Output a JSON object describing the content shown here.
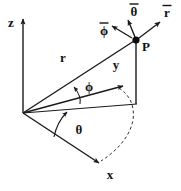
{
  "figure": {
    "type": "spherical-coordinate-diagram",
    "background_color": "#ffffff",
    "stroke_color": "#1a1a1a",
    "width": 181,
    "height": 191
  },
  "axes": [
    {
      "key": "z",
      "label": "z",
      "label_x": 11,
      "label_y": 24,
      "arrow": "up"
    },
    {
      "key": "y",
      "label": "y",
      "label_x": 116,
      "label_y": 66,
      "arrow": "up-right"
    },
    {
      "key": "x",
      "label": "x",
      "label_x": 110,
      "label_y": 176,
      "arrow": "down-right"
    }
  ],
  "point": {
    "label": "P",
    "label_x": 146,
    "label_y": 48,
    "x": 136,
    "y": 40
  },
  "unit_vectors": [
    {
      "key": "r-hat",
      "label": "r",
      "bar": true,
      "label_x": 167,
      "label_y": 14
    },
    {
      "key": "theta-hat",
      "label": "θ",
      "bar": true,
      "label_x": 134,
      "label_y": 13
    },
    {
      "key": "phi-hat",
      "label": "ϕ",
      "bar": true,
      "label_x": 104,
      "label_y": 32
    }
  ],
  "measures": [
    {
      "key": "radius",
      "label": "r",
      "label_x": 63,
      "label_y": 59
    },
    {
      "key": "polar-angle",
      "label": "ϕ",
      "label_x": 89,
      "label_y": 88
    },
    {
      "key": "azimuth",
      "label": "θ",
      "label_x": 79,
      "label_y": 131
    }
  ],
  "origin": {
    "x": 23,
    "y": 113
  }
}
